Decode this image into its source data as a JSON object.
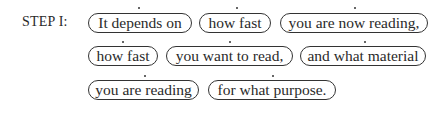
{
  "step": {
    "label": "STEP I:"
  },
  "rows": [
    {
      "phrases": [
        {
          "text": "It depends on"
        },
        {
          "text": "how fast"
        },
        {
          "text": "you are now reading,"
        }
      ]
    },
    {
      "phrases": [
        {
          "text": "how fast"
        },
        {
          "text": "you want to read,"
        },
        {
          "text": "and what material"
        }
      ]
    },
    {
      "phrases": [
        {
          "text": "you are reading"
        },
        {
          "text": "for what purpose."
        }
      ]
    }
  ]
}
